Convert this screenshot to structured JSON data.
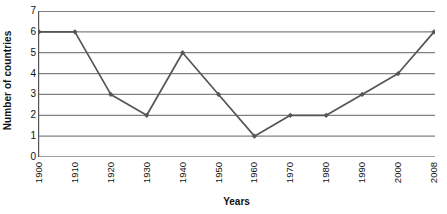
{
  "chart_data": {
    "type": "line",
    "title": "",
    "xlabel": "Years",
    "ylabel": "Number of countries",
    "categories": [
      "1900",
      "1910",
      "1920",
      "1930",
      "1940",
      "1950",
      "1960",
      "1970",
      "1980",
      "1990",
      "2000",
      "2008"
    ],
    "values": [
      6,
      6,
      3,
      2,
      5,
      3,
      1,
      2,
      2,
      3,
      4,
      6
    ],
    "series": [
      {
        "name": "Number of countries",
        "values": [
          6,
          6,
          3,
          2,
          5,
          3,
          1,
          2,
          2,
          3,
          4,
          6
        ]
      }
    ],
    "yticks": [
      0,
      1,
      2,
      3,
      4,
      5,
      6,
      7
    ],
    "ytick_labels": [
      "0",
      "1",
      "2",
      "3",
      "4",
      "5",
      "6",
      "7"
    ],
    "ylim": [
      0,
      7
    ],
    "grid": "horizontal",
    "legend": "none",
    "marker": "diamond",
    "line_color": "#555555",
    "grid_color": "#808080",
    "axis_color": "#555555",
    "background": "#ffffff",
    "text_color": "#111111"
  }
}
